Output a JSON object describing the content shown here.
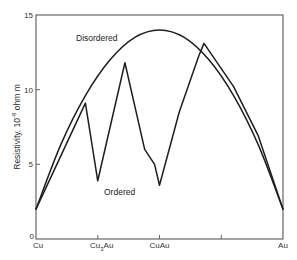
{
  "chart_data": {
    "type": "line",
    "title": "",
    "xlabel": "",
    "ylabel": "Resistivity, 10⁻⁸ ohm m",
    "ylabel_main": "Resistivity, 10",
    "ylabel_exp": "-8",
    "ylabel_unit": " ohm m",
    "xlim": [
      0,
      100
    ],
    "ylim": [
      0,
      15
    ],
    "grid": false,
    "x_ticks": [
      {
        "pos": 0,
        "label": "Cu"
      },
      {
        "pos": 25,
        "label": "Cu3Au",
        "label_main": "Cu",
        "label_sub": "3",
        "label_tail": "Au"
      },
      {
        "pos": 50,
        "label": "CuAu"
      },
      {
        "pos": 75,
        "label": ""
      },
      {
        "pos": 100,
        "label": "Au"
      }
    ],
    "y_ticks": [
      {
        "value": 0,
        "label": "0"
      },
      {
        "value": 5,
        "label": "5"
      },
      {
        "value": 10,
        "label": "10"
      },
      {
        "value": 15,
        "label": "15"
      }
    ],
    "series": [
      {
        "name": "Disordered",
        "x": [
          0,
          10,
          20,
          30,
          40,
          50,
          60,
          70,
          80,
          90,
          100
        ],
        "values": [
          2.0,
          6.3,
          9.6,
          12.0,
          13.5,
          14.0,
          13.5,
          12.0,
          9.6,
          6.3,
          2.0
        ]
      },
      {
        "name": "Ordered",
        "x": [
          0,
          20,
          25,
          36,
          44,
          48,
          50,
          58,
          66,
          68,
          80,
          90,
          100
        ],
        "values": [
          2.0,
          9.1,
          3.9,
          11.8,
          6.0,
          5.0,
          3.6,
          8.5,
          12.3,
          13.1,
          10.2,
          6.9,
          2.0
        ]
      }
    ],
    "annotations": [
      {
        "text": "Disordered",
        "x": 22,
        "y": 13.2
      },
      {
        "text": "Ordered",
        "x": 33,
        "y": 3.0
      }
    ]
  },
  "colors": {
    "line": "#1e1e1e",
    "axis": "#555555",
    "background": "#ffffff"
  }
}
